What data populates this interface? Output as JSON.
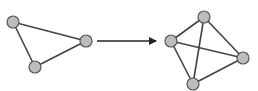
{
  "diagram": {
    "type": "graph-transformation",
    "colors": {
      "background": "#ffffff",
      "edge": "#444444",
      "node_fill": "#bdbdbd",
      "node_stroke": "#555555",
      "arrow": "#222222"
    },
    "node_radius": 6,
    "graphs": [
      {
        "name": "triangle",
        "nodes": [
          {
            "id": "a",
            "x": 13,
            "y": 22
          },
          {
            "id": "b",
            "x": 86,
            "y": 41
          },
          {
            "id": "c",
            "x": 35,
            "y": 67
          }
        ],
        "edges": [
          [
            "a",
            "b"
          ],
          [
            "b",
            "c"
          ],
          [
            "c",
            "a"
          ]
        ]
      },
      {
        "name": "complete-k4",
        "nodes": [
          {
            "id": "p",
            "x": 204,
            "y": 17
          },
          {
            "id": "q",
            "x": 171,
            "y": 41
          },
          {
            "id": "r",
            "x": 243,
            "y": 58
          },
          {
            "id": "s",
            "x": 193,
            "y": 84
          }
        ],
        "edges": [
          [
            "p",
            "q"
          ],
          [
            "p",
            "r"
          ],
          [
            "p",
            "s"
          ],
          [
            "q",
            "r"
          ],
          [
            "q",
            "s"
          ],
          [
            "r",
            "s"
          ]
        ]
      }
    ],
    "arrow": {
      "x1": 97,
      "y1": 41,
      "x2": 156,
      "y2": 41
    }
  }
}
